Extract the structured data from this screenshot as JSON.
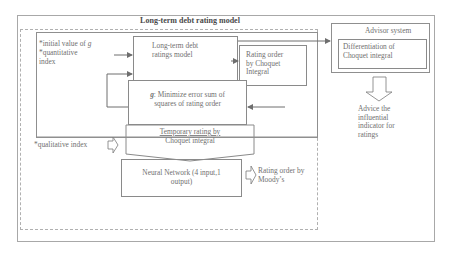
{
  "diagram": {
    "main_title": "Long-term debt rating model",
    "inputs": {
      "initial_value_line": "*initial value of ",
      "initial_value_symbol": "g",
      "quantitative_line1": "*quantitative",
      "quantitative_line2": "index",
      "qualitative": "*qualitative index"
    },
    "boxes": {
      "ratings_model": {
        "line1": "Long-term debt",
        "line2": "ratings model"
      },
      "rating_order_choquet": {
        "line1": "Rating order",
        "line2": "by Choquet",
        "line3": "Integral"
      },
      "minimize_error": {
        "symbol": "g",
        "line1_rest": ": Minimize error sum of",
        "line2": "squares of rating order"
      },
      "temporary_rating": {
        "line1": "Temporary rating by",
        "line2": "Choquet integral"
      },
      "neural_network": {
        "line1": "Neural Network (4 input,1",
        "line2": "output)"
      }
    },
    "outputs": {
      "moodys_line1": "Rating order by",
      "moodys_line2": "Moody’s"
    },
    "advisor": {
      "title": "Advisor system",
      "inner_line1": "Differentiation of",
      "inner_line2": "Choquet integral",
      "advice_line1": "Advice the",
      "advice_line2": "influential",
      "advice_line3": "indicator for",
      "advice_line4": "ratings"
    },
    "colors": {
      "line": "#8a8a8a",
      "dashed": "#b0b0b0",
      "arrow": "#6e6e6e",
      "text": "#707070"
    }
  }
}
